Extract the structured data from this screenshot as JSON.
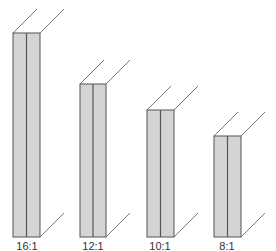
{
  "figure": {
    "fill_color": "#d4d4d4",
    "line_color": "#555555",
    "slabs": [
      {
        "label": "16:1",
        "x": 13,
        "top": 33,
        "bottom": 237,
        "width": 27
      },
      {
        "label": "12:1",
        "x": 80,
        "top": 84,
        "bottom": 237,
        "width": 26
      },
      {
        "label": "10:1",
        "x": 147,
        "top": 110,
        "bottom": 237,
        "width": 27
      },
      {
        "label": "8:1",
        "x": 214,
        "top": 136,
        "bottom": 237,
        "width": 27
      }
    ]
  }
}
